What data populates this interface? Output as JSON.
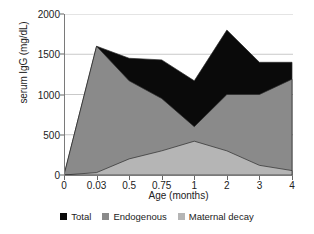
{
  "chart_data": {
    "type": "area",
    "title": "",
    "xlabel": "Age (months)",
    "ylabel": "serum IgG (mg/dL)",
    "categories": [
      "0",
      "0.03",
      "0.5",
      "0.75",
      "1",
      "2",
      "3",
      "4"
    ],
    "ylim": [
      0,
      2000
    ],
    "yticks": [
      0,
      500,
      1000,
      1500,
      2000
    ],
    "grid": true,
    "legend_position": "bottom",
    "series": [
      {
        "name": "Total",
        "color": "#0a0a0a",
        "values": [
          0,
          1600,
          1450,
          1430,
          1170,
          1800,
          1400,
          1400
        ]
      },
      {
        "name": "Endogenous",
        "color": "#8a8a8a",
        "values": [
          0,
          1600,
          1170,
          950,
          600,
          1000,
          1000,
          1190
        ]
      },
      {
        "name": "Maternal decay",
        "color": "#b5b5b5",
        "values": [
          0,
          30,
          200,
          300,
          420,
          300,
          120,
          55
        ]
      }
    ]
  },
  "axes": {
    "y_tick_labels": [
      "0",
      "500",
      "1000",
      "1500",
      "2000"
    ],
    "x_tick_labels": [
      "0",
      "0.03",
      "0.5",
      "0.75",
      "1",
      "2",
      "3",
      "4"
    ],
    "y_axis_title": "serum IgG (mg/dL)",
    "x_axis_title": "Age (months)"
  },
  "legend": {
    "items": [
      {
        "label": "Total",
        "color": "#0a0a0a"
      },
      {
        "label": "Endogenous",
        "color": "#8a8a8a"
      },
      {
        "label": "Maternal decay",
        "color": "#b5b5b5"
      }
    ]
  },
  "style": {
    "grid_color": "#c9c9c9",
    "axis_color": "#7a7a7a",
    "plot_background": "#ffffff"
  }
}
